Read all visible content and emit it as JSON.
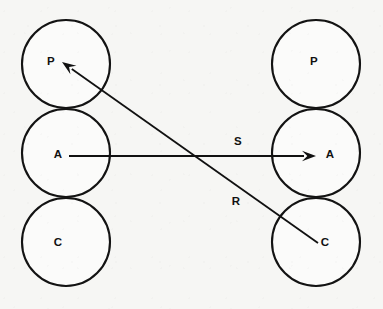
{
  "diagram": {
    "background_color": "#f6f6f4",
    "ink_color": "#111111",
    "circle_radius": 44,
    "circle_stroke_width": 2.1,
    "columns": [
      {
        "name": "left-column",
        "center_x": 66,
        "nodes": [
          {
            "id": "left-p",
            "label": "P",
            "cx": 66,
            "cy": 64,
            "label_x": 51,
            "label_y": 62
          },
          {
            "id": "left-a",
            "label": "A",
            "cx": 66,
            "cy": 153,
            "label_x": 58,
            "label_y": 155
          },
          {
            "id": "left-c",
            "label": "C",
            "cx": 66,
            "cy": 242,
            "label_x": 58,
            "label_y": 243
          }
        ]
      },
      {
        "name": "right-column",
        "center_x": 316,
        "nodes": [
          {
            "id": "right-p",
            "label": "P",
            "cx": 316,
            "cy": 64,
            "label_x": 314,
            "label_y": 62
          },
          {
            "id": "right-a",
            "label": "A",
            "cx": 316,
            "cy": 153,
            "label_x": 330,
            "label_y": 155
          },
          {
            "id": "right-c",
            "label": "C",
            "cx": 316,
            "cy": 242,
            "label_x": 325,
            "label_y": 243
          }
        ]
      }
    ],
    "edges": [
      {
        "id": "edge-s",
        "label": "S",
        "label_x": 238,
        "label_y": 142,
        "from_node": "left-a",
        "to_node": "right-a",
        "x1": 69,
        "y1": 156,
        "x2": 316,
        "y2": 156,
        "arrow_at": "end",
        "stroke_width": 1.8
      },
      {
        "id": "edge-r",
        "label": "R",
        "label_x": 236,
        "label_y": 202,
        "from_node": "right-c",
        "to_node": "left-p",
        "x1": 318,
        "y1": 243,
        "x2": 62,
        "y2": 62,
        "arrow_at": "end",
        "stroke_width": 1.8
      }
    ]
  }
}
